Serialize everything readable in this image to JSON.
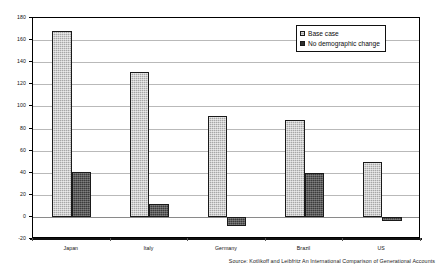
{
  "chart_data": {
    "type": "bar",
    "title": "",
    "subtitle": "",
    "xlabel": "",
    "ylabel": "",
    "categories": [
      "Japan",
      "Italy",
      "Germany",
      "Brazil",
      "US"
    ],
    "series": [
      {
        "name": "Base case",
        "values": [
          168,
          131,
          91,
          88,
          50
        ],
        "color": "#a6a6a6"
      },
      {
        "name": "No demographic change",
        "values": [
          41,
          12,
          -8,
          40,
          -4
        ],
        "color": "#3c3c3c"
      }
    ],
    "ylim": [
      -20,
      180
    ],
    "yticks": [
      -20,
      0,
      20,
      40,
      60,
      80,
      100,
      120,
      140,
      160,
      180
    ],
    "ytick_labels": [
      "-20",
      "0",
      "20",
      "40",
      "60",
      "80",
      "100",
      "120",
      "140",
      "160",
      "180"
    ],
    "grid": true,
    "legend_position": "top-right",
    "annotations": [
      "Source: Kotlikoff and Leibfritz An International Comparison of Generational Accounts"
    ]
  },
  "legend": {
    "items": [
      {
        "label": "Base case"
      },
      {
        "label": "No demographic change"
      }
    ]
  },
  "source": {
    "text": "Source: Kotlikoff and Leibfritz An International Comparison of Generational Accounts"
  }
}
